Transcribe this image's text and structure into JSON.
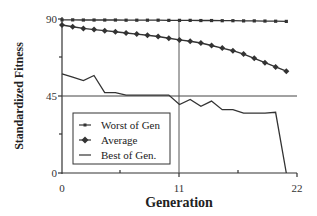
{
  "chart_data": {
    "type": "line",
    "title": "",
    "xlabel": "Generation",
    "ylabel": "Standardized Fitness",
    "xlim": [
      0,
      22
    ],
    "ylim": [
      0,
      90
    ],
    "x_ticks": [
      "0",
      "11",
      "22"
    ],
    "y_ticks": [
      "0",
      "45",
      "90"
    ],
    "grid": false,
    "reference_lines": [
      {
        "orientation": "horizontal",
        "value": 45
      },
      {
        "orientation": "vertical",
        "value": 11
      }
    ],
    "legend_position": "lower-left inside plot",
    "x": [
      0,
      1,
      2,
      3,
      4,
      5,
      6,
      7,
      8,
      9,
      10,
      11,
      12,
      13,
      14,
      15,
      16,
      17,
      18,
      19,
      20,
      21
    ],
    "series": [
      {
        "name": "Worst of Gen",
        "marker": "small-square",
        "values": [
          89.5,
          89.5,
          89.4,
          89.4,
          89.4,
          89.4,
          89.3,
          89.3,
          89.3,
          89.3,
          89.2,
          89.2,
          89.2,
          89.1,
          89.1,
          89.0,
          89.0,
          88.9,
          88.9,
          88.8,
          88.7,
          88.6
        ]
      },
      {
        "name": "Average",
        "marker": "diamond",
        "values": [
          86.5,
          85.5,
          84.5,
          83.8,
          83.2,
          82.5,
          81.8,
          81.2,
          80.5,
          79.8,
          78.8,
          77.8,
          77.0,
          76.0,
          74.5,
          73.0,
          71.5,
          69.5,
          67.0,
          64.5,
          62.0,
          59.5
        ]
      },
      {
        "name": "Best of Gen.",
        "marker": "none",
        "values": [
          58.0,
          56.0,
          54.0,
          57.0,
          47.0,
          47.0,
          45.5,
          45.5,
          45.5,
          45.5,
          45.5,
          40.0,
          43.0,
          39.0,
          42.0,
          37.0,
          37.0,
          35.0,
          35.0,
          35.0,
          35.5,
          0.0
        ]
      }
    ]
  },
  "axes": {
    "y_tick_labels": [
      "90",
      "45",
      "0"
    ],
    "x_tick_labels": [
      "0",
      "11",
      "22"
    ],
    "ylabel": "Standardized Fitness",
    "xlabel": "Generation"
  },
  "legend": {
    "items": [
      {
        "label": "Worst of Gen"
      },
      {
        "label": "Average"
      },
      {
        "label": "Best of Gen."
      }
    ]
  }
}
